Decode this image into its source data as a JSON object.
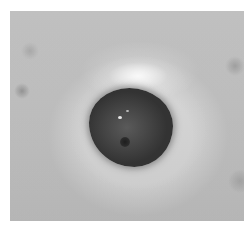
{
  "image": {
    "description": "Grayscale clinical photograph of a stoma on skin, centered, with white border",
    "subject": "stoma",
    "colors": {
      "background": "#ffffff",
      "skin": "#d0d0d0",
      "stoma": "#454545"
    }
  }
}
